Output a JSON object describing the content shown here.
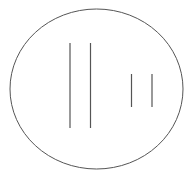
{
  "diagram": {
    "width": 192,
    "height": 178,
    "background": "#ffffff",
    "stroke_color": "#555555",
    "ellipse": {
      "cx": 96.5,
      "cy": 89,
      "rx": 86.5,
      "ry": 80,
      "stroke_width": 1
    },
    "lines": [
      {
        "name": "long-line-1",
        "x": 70,
        "y1": 43,
        "y2": 128
      },
      {
        "name": "long-line-2",
        "x": 90.5,
        "y1": 43,
        "y2": 128
      },
      {
        "name": "short-line-1",
        "x": 131.5,
        "y1": 74,
        "y2": 107
      },
      {
        "name": "short-line-2",
        "x": 152,
        "y1": 74,
        "y2": 107
      }
    ]
  }
}
